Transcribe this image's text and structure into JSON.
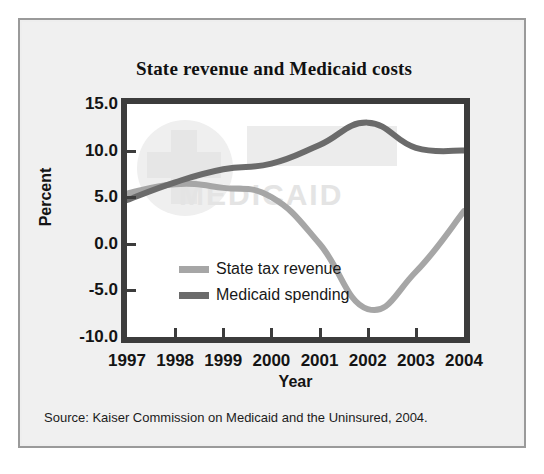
{
  "figure": {
    "title": "State revenue and Medicaid costs",
    "source": "Source: Kaiser Commission on Medicaid and the Uninsured, 2004.",
    "watermark": "MEDICAID",
    "panel_bg": "#eeeeee",
    "panel_border": "#9a9a9a",
    "frame_color": "#3c3c3c"
  },
  "chart_data": {
    "type": "line",
    "title": "State revenue and Medicaid costs",
    "xlabel": "Year",
    "ylabel": "Percent",
    "x": [
      1997,
      1998,
      1999,
      2000,
      2001,
      2002,
      2003,
      2004
    ],
    "xticklabels": [
      "1997",
      "1998",
      "1999",
      "2000",
      "2001",
      "2002",
      "2003",
      "2004"
    ],
    "yticklabels": [
      "15.0",
      "10.0",
      "5.0",
      "0.0",
      "-5.0",
      "-10.0"
    ],
    "yticks": [
      15.0,
      10.0,
      5.0,
      0.0,
      -5.0,
      -10.0
    ],
    "ylim": [
      -10.0,
      15.0
    ],
    "xlim": [
      1997,
      2004
    ],
    "grid": false,
    "legend_position": "center-left inside axes",
    "series": [
      {
        "name": "State tax revenue",
        "color": "#a6a6a6",
        "values": [
          5.4,
          6.4,
          6.0,
          5.0,
          0.0,
          -7.0,
          -3.0,
          3.5
        ]
      },
      {
        "name": "Medicaid spending",
        "color": "#6b6b6b",
        "values": [
          4.7,
          6.6,
          8.0,
          8.6,
          10.6,
          13.0,
          10.3,
          10.0
        ]
      }
    ]
  },
  "legend": {
    "items": [
      {
        "label": "State tax revenue",
        "color": "#a6a6a6"
      },
      {
        "label": "Medicaid spending",
        "color": "#6b6b6b"
      }
    ]
  }
}
